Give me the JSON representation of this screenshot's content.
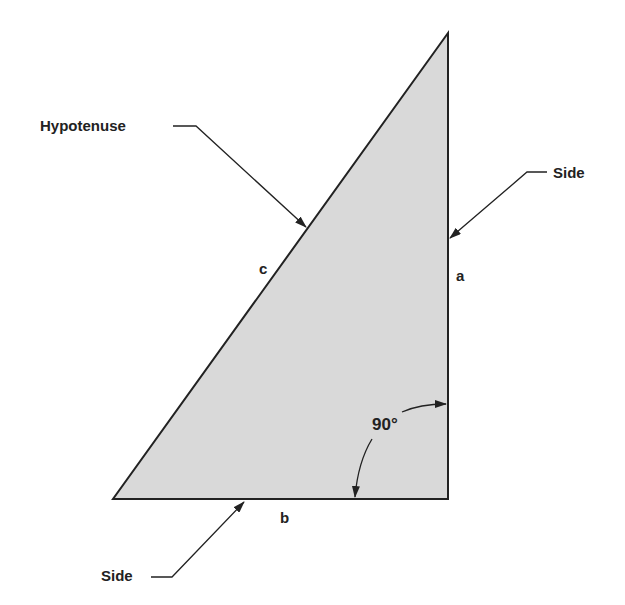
{
  "diagram": {
    "shape": "right-triangle",
    "fill_color": "#d9d9d9",
    "stroke_color": "#222222",
    "vertices": {
      "top": [
        448,
        33
      ],
      "bottom_left": [
        113,
        499
      ],
      "right_angle": [
        448,
        499
      ]
    },
    "callouts": {
      "hypotenuse": "Hypotenuse",
      "side_right": "Side",
      "side_bottom": "Side"
    },
    "side_letters": {
      "a": "a",
      "b": "b",
      "c": "c"
    },
    "angle_label": "90°"
  }
}
